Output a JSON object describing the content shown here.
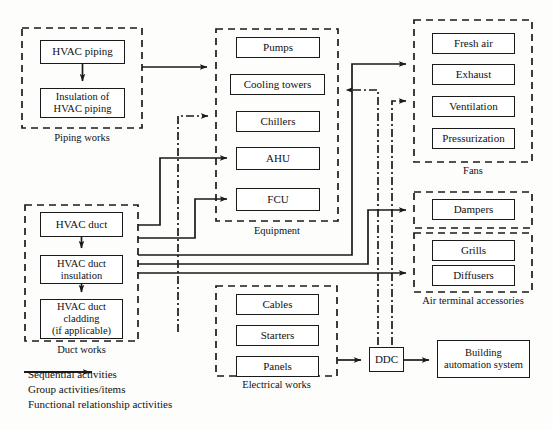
{
  "diagram": {
    "line_color": "#1a1a1a",
    "box_fill": "#ffffff",
    "groups": [
      {
        "id": "piping",
        "label": "Piping works",
        "x": 22,
        "y": 28,
        "w": 120,
        "h": 100
      },
      {
        "id": "equipment",
        "label": "Equipment",
        "x": 216,
        "y": 29,
        "w": 122,
        "h": 192
      },
      {
        "id": "fans",
        "label": "Fans",
        "x": 414,
        "y": 20,
        "w": 118,
        "h": 142
      },
      {
        "id": "dampers",
        "label": "",
        "x": 414,
        "y": 192,
        "w": 118,
        "h": 36
      },
      {
        "id": "airterm",
        "label": "Air terminal accessories",
        "x": 414,
        "y": 233,
        "w": 118,
        "h": 59
      },
      {
        "id": "duct",
        "label": "Duct works",
        "x": 25,
        "y": 205,
        "w": 113,
        "h": 136
      },
      {
        "id": "electrical",
        "label": "Electrical works",
        "x": 216,
        "y": 286,
        "w": 121,
        "h": 90
      }
    ],
    "nodes": [
      {
        "id": "hvac-piping",
        "label": "HVAC piping",
        "x": 40,
        "y": 40,
        "w": 85,
        "h": 24,
        "lines": 1
      },
      {
        "id": "insulation-piping",
        "label": "Insulation of\nHVAC piping",
        "x": 40,
        "y": 88,
        "w": 85,
        "h": 30,
        "lines": 2
      },
      {
        "id": "pumps",
        "label": "Pumps",
        "x": 236,
        "y": 37,
        "w": 84,
        "h": 21,
        "lines": 1
      },
      {
        "id": "cooling-towers",
        "label": "Cooling towers",
        "x": 230,
        "y": 74,
        "w": 95,
        "h": 21,
        "lines": 1
      },
      {
        "id": "chillers",
        "label": "Chillers",
        "x": 236,
        "y": 111,
        "w": 84,
        "h": 21,
        "lines": 1
      },
      {
        "id": "ahu",
        "label": "AHU",
        "x": 236,
        "y": 147,
        "w": 84,
        "h": 23,
        "lines": 1
      },
      {
        "id": "fcu",
        "label": "FCU",
        "x": 236,
        "y": 188,
        "w": 84,
        "h": 23,
        "lines": 1
      },
      {
        "id": "fresh-air",
        "label": "Fresh air",
        "x": 432,
        "y": 33,
        "w": 83,
        "h": 21,
        "lines": 1
      },
      {
        "id": "exhaust",
        "label": "Exhaust",
        "x": 432,
        "y": 64,
        "w": 83,
        "h": 21,
        "lines": 1
      },
      {
        "id": "ventilation",
        "label": "Ventilation",
        "x": 432,
        "y": 96,
        "w": 83,
        "h": 21,
        "lines": 1
      },
      {
        "id": "pressurization",
        "label": "Pressurization",
        "x": 432,
        "y": 128,
        "w": 83,
        "h": 21,
        "lines": 1
      },
      {
        "id": "dampers-box",
        "label": "Dampers",
        "x": 432,
        "y": 199,
        "w": 83,
        "h": 21,
        "lines": 1
      },
      {
        "id": "grills",
        "label": "Grills",
        "x": 432,
        "y": 240,
        "w": 83,
        "h": 21,
        "lines": 1
      },
      {
        "id": "diffusers",
        "label": "Diffusers",
        "x": 432,
        "y": 265,
        "w": 83,
        "h": 21,
        "lines": 1
      },
      {
        "id": "hvac-duct",
        "label": "HVAC duct",
        "x": 40,
        "y": 212,
        "w": 83,
        "h": 25,
        "lines": 1
      },
      {
        "id": "duct-insulation",
        "label": "HVAC duct\ninsulation",
        "x": 40,
        "y": 255,
        "w": 83,
        "h": 29,
        "lines": 2
      },
      {
        "id": "duct-cladding",
        "label": "HVAC duct\ncladding\n(if applicable)",
        "x": 40,
        "y": 299,
        "w": 83,
        "h": 40,
        "lines": 3
      },
      {
        "id": "cables",
        "label": "Cables",
        "x": 236,
        "y": 294,
        "w": 83,
        "h": 21,
        "lines": 1
      },
      {
        "id": "starters",
        "label": "Starters",
        "x": 236,
        "y": 325,
        "w": 83,
        "h": 21,
        "lines": 1
      },
      {
        "id": "panels",
        "label": "Panels",
        "x": 236,
        "y": 356,
        "w": 83,
        "h": 21,
        "lines": 1
      },
      {
        "id": "ddc",
        "label": "DDC",
        "x": 369,
        "y": 347,
        "w": 35,
        "h": 25,
        "lines": 1
      },
      {
        "id": "bas",
        "label": "Building\nautomation system",
        "x": 437,
        "y": 340,
        "w": 93,
        "h": 38,
        "lines": 2
      }
    ],
    "legend": [
      {
        "id": "sequential",
        "label": "Sequential activities",
        "style": "solid-arrow"
      },
      {
        "id": "group",
        "label": "Group activities/items",
        "style": "dashed"
      },
      {
        "id": "functional",
        "label": "Functional relationship activities",
        "style": "dashdot"
      }
    ]
  }
}
